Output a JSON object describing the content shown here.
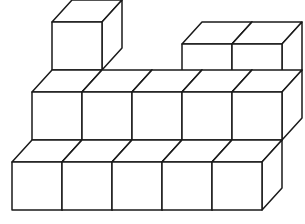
{
  "figure": {
    "background_color": "#ffffff",
    "stroke_color": "#1a1a1a",
    "stroke_width": 1.5,
    "face_fill": "#ffffff",
    "cube_count": 13
  },
  "projection": {
    "origin_x": 12,
    "origin_y": 210,
    "unit_x": [
      50,
      0
    ],
    "unit_y": [
      20,
      -22
    ],
    "unit_z": [
      0,
      -48
    ],
    "note": "x = rightward along front row, y = depth going back-up-right, z = vertical up"
  },
  "chart_data": {
    "type": "table",
    "columns": [
      "index",
      "x",
      "y",
      "z"
    ],
    "cubes": [
      {
        "index": 1,
        "x": 0,
        "y": 0,
        "z": 0,
        "label": "front-left-low"
      },
      {
        "index": 2,
        "x": 1,
        "y": 0,
        "z": 0,
        "label": "front-row-2"
      },
      {
        "index": 3,
        "x": 2,
        "y": 0,
        "z": 0,
        "label": "front-row-3"
      },
      {
        "index": 4,
        "x": 3,
        "y": 0,
        "z": 0,
        "label": "front-row-4"
      },
      {
        "index": 5,
        "x": 4,
        "y": 0,
        "z": 0,
        "label": "front-row-5-right"
      },
      {
        "index": 6,
        "x": 0,
        "y": 1,
        "z": 1,
        "label": "left-mid"
      },
      {
        "index": 7,
        "x": 1,
        "y": 1,
        "z": 1,
        "label": "back-row-mid-1"
      },
      {
        "index": 8,
        "x": 2,
        "y": 1,
        "z": 1,
        "label": "back-row-mid-2"
      },
      {
        "index": 9,
        "x": 3,
        "y": 1,
        "z": 1,
        "label": "back-row-mid-3"
      },
      {
        "index": 10,
        "x": 4,
        "y": 1,
        "z": 1,
        "label": "right-tower-mid"
      },
      {
        "index": 11,
        "x": 0,
        "y": 2,
        "z": 2,
        "label": "left-tower-top"
      },
      {
        "index": 12,
        "x": 3,
        "y": 1,
        "z": 2,
        "label": "center-tower-top"
      },
      {
        "index": 13,
        "x": 4,
        "y": 1,
        "z": 2,
        "label": "right-tower-top"
      }
    ],
    "layer_counts": [
      5,
      5,
      3
    ],
    "xlabel": "",
    "ylabel": ""
  }
}
